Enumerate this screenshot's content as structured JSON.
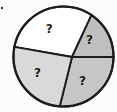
{
  "figure": {
    "kind": "pie-chart-figure",
    "bullet_marker": "▪"
  },
  "chart_data": {
    "type": "pie",
    "title": "",
    "values_shown": false,
    "labels": [
      "?",
      "?",
      "?",
      "?"
    ],
    "outline_color": "#1c1c1c",
    "background_color": "#fcfcfc",
    "segments": [
      {
        "name": "top-slice",
        "label": "?",
        "start_angle": 65,
        "end_angle": 170,
        "percent_est": 29,
        "color": "#ffffff"
      },
      {
        "name": "right-slice",
        "label": "?",
        "start_angle": 0,
        "end_angle": 65,
        "percent_est": 18,
        "color": "#bfbfbf"
      },
      {
        "name": "bottom-slice",
        "label": "?",
        "start_angle": 256,
        "end_angle": 360,
        "percent_est": 29,
        "color": "#c6c6c6"
      },
      {
        "name": "left-slice",
        "label": "?",
        "start_angle": 170,
        "end_angle": 256,
        "percent_est": 24,
        "color": "#d9d9d9"
      }
    ]
  }
}
